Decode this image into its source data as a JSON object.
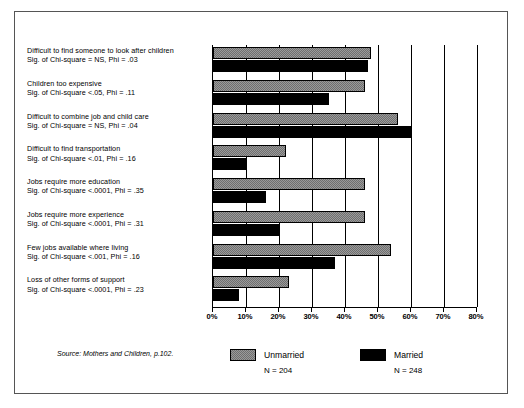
{
  "source_note": "Source: Mothers and Children, p.102.",
  "legend": {
    "unmarried": {
      "label": "Unmarried",
      "n": "N = 204",
      "color": "#9a9a9a"
    },
    "married": {
      "label": "Married",
      "n": "N = 248",
      "color": "#000000"
    }
  },
  "chart_data": {
    "type": "bar",
    "orientation": "horizontal",
    "title": "",
    "xlabel": "",
    "ylabel": "",
    "xlim": [
      0,
      80
    ],
    "grid": true,
    "legend_position": "bottom",
    "tick_labels": [
      "0%",
      "10%",
      "20%",
      "30%",
      "40%",
      "50%",
      "60%",
      "70%",
      "80%"
    ],
    "tick_values": [
      0,
      10,
      20,
      30,
      40,
      50,
      60,
      70,
      80
    ],
    "categories": [
      "Difficult to find someone to look after children",
      "Children too expensive",
      "Difficult to combine job and child care",
      "Difficult to find transportation",
      "Jobs require more education",
      "Jobs require more experience",
      "Few jobs available where living",
      "Loss of other forms of support"
    ],
    "stat_lines": [
      "Sig. of Chi-square = NS, Phi = .03",
      "Sig. of Chi-square <.05, Phi = .11",
      "Sig. of Chi-square = NS, Phi = .04",
      "Sig. of Chi-square <.01, Phi = .16",
      "Sig. of Chi-square <.0001, Phi = .35",
      "Sig. of Chi-square <.0001, Phi = .31",
      "Sig. of Chi-square <.001, Phi = .16",
      "Sig. of Chi-square <.0001, Phi = .23"
    ],
    "series": [
      {
        "name": "Unmarried",
        "values": [
          48,
          46,
          56,
          22,
          46,
          46,
          54,
          23
        ]
      },
      {
        "name": "Married",
        "values": [
          47,
          35,
          60,
          10,
          16,
          20,
          37,
          8
        ]
      }
    ]
  }
}
